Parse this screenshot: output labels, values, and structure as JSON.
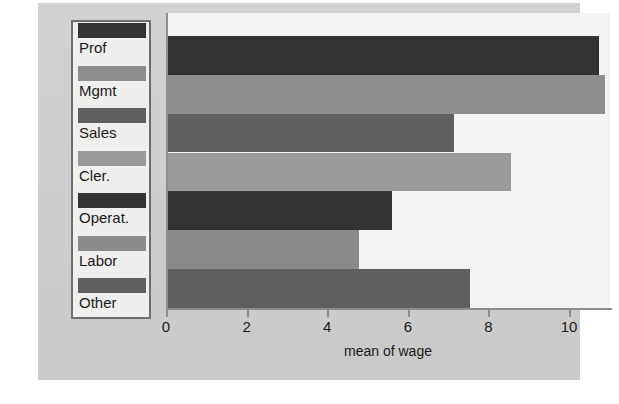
{
  "chart_data": {
    "type": "bar",
    "orientation": "horizontal",
    "title": "",
    "xlabel": "mean of wage",
    "ylabel": "",
    "categories": [
      "Prof",
      "Mgmt",
      "Sales",
      "Cler.",
      "Operat.",
      "Labor",
      "Other"
    ],
    "values": [
      10.7,
      10.85,
      7.1,
      8.5,
      5.55,
      4.75,
      7.5
    ],
    "series": [
      {
        "name": "mean of wage",
        "values": [
          10.7,
          10.85,
          7.1,
          8.5,
          5.55,
          4.75,
          7.5
        ]
      }
    ],
    "xlim": [
      0,
      11.0
    ],
    "xticks": [
      0,
      2,
      4,
      6,
      8,
      10
    ],
    "xticklabels": [
      "0",
      "2",
      "4",
      "6",
      "8",
      "10"
    ],
    "grid": false,
    "legend_position": "left-outside",
    "bar_colors": [
      "#333333",
      "#8e8e8e",
      "#5f5f5f",
      "#9a9a9a",
      "#333333",
      "#8a8a8a",
      "#5f5f5f"
    ],
    "background_color": "#cfcfcf",
    "plot_background_color": "#f3f3f1",
    "axis_color": "#8c8c8c"
  },
  "legend": {
    "items": [
      {
        "label": "Prof",
        "color": "#333333"
      },
      {
        "label": "Mgmt",
        "color": "#8e8e8e"
      },
      {
        "label": "Sales",
        "color": "#5f5f5f"
      },
      {
        "label": "Cler.",
        "color": "#9a9a9a"
      },
      {
        "label": "Operat.",
        "color": "#333333"
      },
      {
        "label": "Labor",
        "color": "#8a8a8a"
      },
      {
        "label": "Other",
        "color": "#5f5f5f"
      }
    ]
  },
  "axis": {
    "x_label": "mean of wage",
    "tick_labels": [
      "0",
      "2",
      "4",
      "6",
      "8",
      "10"
    ]
  }
}
